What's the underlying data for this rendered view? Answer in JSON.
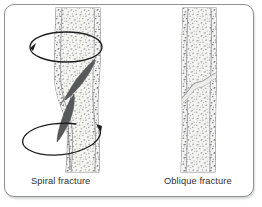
{
  "figure": {
    "title_present": false,
    "panel_count": 2,
    "background_color": "#ffffff",
    "frame": {
      "border_color": "#8d8f91",
      "corner_radius_px": 10,
      "shadow": true
    },
    "palette": {
      "bone_fill": "#f2f2f0",
      "bone_outline": "#8a8c8e",
      "cortical_line": "#9a9c9e",
      "trabecular_speck": "#6f7173",
      "fragment_dark": "#58595b",
      "fragment_mid": "#77797b",
      "arrow_stroke": "#1d1d1f",
      "caption_text": "#2f2f31"
    },
    "panels": [
      {
        "id": "spiral",
        "caption": "Spiral fracture",
        "bone_type": "long-bone-shaft",
        "fracture_pattern": "spiral",
        "has_rotation_arrows": true,
        "rotation_arrow_count": 2,
        "rotation_arrows": [
          {
            "position": "upper",
            "arrowhead_direction": "up-left"
          },
          {
            "position": "lower",
            "arrowhead_direction": "right-down"
          }
        ],
        "fragment_count": 2,
        "shaft_deformity": "bulged-at-fracture-site"
      },
      {
        "id": "oblique",
        "caption": "Oblique fracture",
        "bone_type": "long-bone-shaft",
        "fracture_pattern": "oblique",
        "has_rotation_arrows": false,
        "rotation_arrow_count": 0,
        "rotation_arrows": [],
        "fragment_count": 0,
        "shaft_deformity": "slight-offset-at-fracture-line"
      }
    ]
  }
}
